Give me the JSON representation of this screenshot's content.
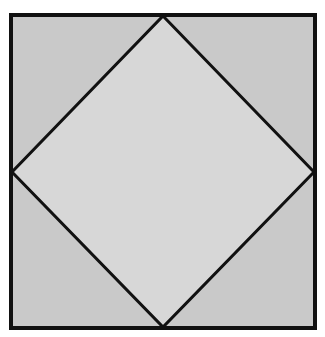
{
  "diagram": {
    "type": "geometric-figure",
    "outer_square": {
      "x1": 11,
      "y1": 15,
      "x2": 315,
      "y2": 328
    },
    "diamond": {
      "top": [
        163,
        16
      ],
      "right": [
        314,
        172
      ],
      "bottom": [
        163,
        327
      ],
      "left": [
        12,
        172
      ]
    },
    "colors": {
      "background": "#ffffff",
      "corner_fill": "#c9c9c9",
      "diamond_fill": "#d7d7d7",
      "stroke": "#111111"
    },
    "stroke_width": 3
  }
}
